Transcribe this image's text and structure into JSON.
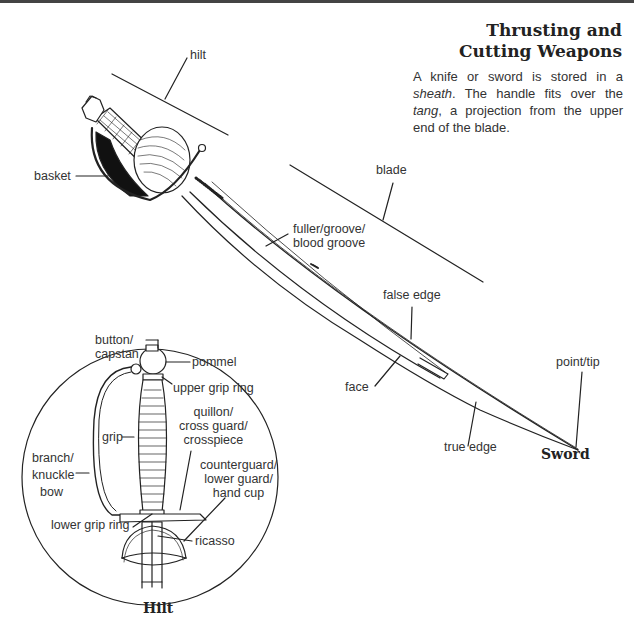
{
  "header": {
    "title_line1": "Thrusting and",
    "title_line2": "Cutting Weapons"
  },
  "description": {
    "part1": "A knife or sword is stored in a ",
    "term1": "sheath",
    "part2": ". The handle fits over the ",
    "term2": "tang",
    "part3": ", a projection from the upper end of the blade."
  },
  "sword": {
    "caption": "Sword",
    "labels": {
      "hilt": "hilt",
      "basket": "basket",
      "blade": "blade",
      "fuller_line1": "fuller/groove/",
      "fuller_line2": "blood groove",
      "false_edge": "false edge",
      "face": "face",
      "point": "point/tip",
      "true_edge": "true edge"
    }
  },
  "hilt_detail": {
    "caption": "Hilt",
    "labels": {
      "button_line1": "button/",
      "button_line2": "capstan",
      "pommel": "pommel",
      "upper_grip_ring": "upper grip ring",
      "quillon_line1": "quillon/",
      "quillon_line2": "cross guard/",
      "quillon_line3": "crosspiece",
      "grip": "grip",
      "branch_line1": "branch/",
      "branch_line2": "knuckle",
      "branch_line3": "bow",
      "counterguard_line1": "counterguard/",
      "counterguard_line2": "lower guard/",
      "counterguard_line3": "hand cup",
      "lower_grip_ring": "lower grip ring",
      "ricasso": "ricasso"
    }
  },
  "colors": {
    "ink": "#222222",
    "background": "#ffffff"
  }
}
